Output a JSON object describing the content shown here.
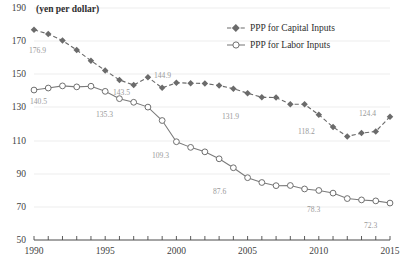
{
  "chart_data": {
    "type": "line",
    "title": "",
    "unit_label": "(yen per dollar)",
    "xlabel": "",
    "ylabel": "",
    "grid": true,
    "legend_position": "top-right",
    "x": [
      1990,
      1991,
      1992,
      1993,
      1994,
      1995,
      1996,
      1997,
      1998,
      1999,
      2000,
      2001,
      2002,
      2003,
      2004,
      2005,
      2006,
      2007,
      2008,
      2009,
      2010,
      2011,
      2012,
      2013,
      2014,
      2015
    ],
    "xlim": [
      1990,
      2015
    ],
    "ylim": [
      50,
      190
    ],
    "ytick_labels": [
      "190",
      "170",
      "150",
      "130",
      "110",
      "90",
      "70",
      "50"
    ],
    "yticks": [
      190,
      170,
      150,
      130,
      110,
      90,
      70,
      50
    ],
    "xtick_labels": [
      "1990",
      "1995",
      "2000",
      "2005",
      "2010",
      "2015"
    ],
    "xticks": [
      1990,
      1995,
      2000,
      2005,
      2010,
      2015
    ],
    "series": [
      {
        "name": "PPP for Capital Inputs",
        "style": "dashed",
        "marker": "filled-diamond",
        "color": "#6b6b6b",
        "values": [
          176.9,
          174.3,
          170.4,
          164.6,
          158.2,
          152.3,
          146.6,
          143.5,
          148.2,
          141.8,
          144.9,
          144.6,
          144.5,
          143.2,
          141.3,
          138.6,
          136.1,
          136.0,
          131.9,
          131.9,
          125.6,
          118.2,
          112.5,
          114.5,
          115.5,
          124.4
        ]
      },
      {
        "name": "PPP for Labor Inputs",
        "style": "solid",
        "marker": "open-circle",
        "color": "#7a7a7a",
        "values": [
          140.5,
          141.7,
          143.0,
          142.4,
          142.8,
          139.7,
          135.3,
          133.1,
          130.2,
          122.1,
          109.3,
          105.9,
          103.2,
          99.0,
          93.6,
          87.6,
          84.7,
          82.8,
          82.9,
          80.8,
          79.9,
          78.3,
          75.0,
          74.2,
          73.6,
          72.3
        ]
      }
    ],
    "annotations": [
      {
        "text": "176.9",
        "x": 1990,
        "y": 176.9,
        "px": 29,
        "py": 53
      },
      {
        "text": "143.5",
        "x": 1997,
        "y": 143.5,
        "px": 113,
        "py": 95
      },
      {
        "text": "135.3",
        "x": 1996,
        "y": 135.3,
        "px": 96,
        "py": 117
      },
      {
        "text": "140.5",
        "x": 1990,
        "y": 140.5,
        "px": 30,
        "py": 104
      },
      {
        "text": "144.9",
        "x": 2000,
        "y": 144.9,
        "px": 154,
        "py": 78
      },
      {
        "text": "131.9",
        "x": 2008,
        "y": 131.9,
        "px": 222,
        "py": 119
      },
      {
        "text": "109.3",
        "x": 2000,
        "y": 109.3,
        "px": 152,
        "py": 158
      },
      {
        "text": "118.2",
        "x": 2011,
        "y": 118.2,
        "px": 298,
        "py": 134
      },
      {
        "text": "87.6",
        "x": 2005,
        "y": 87.6,
        "px": 213,
        "py": 194
      },
      {
        "text": "78.3",
        "x": 2011,
        "y": 78.3,
        "px": 307,
        "py": 212
      },
      {
        "text": "124.4",
        "x": 2015,
        "y": 124.4,
        "px": 359,
        "py": 116
      },
      {
        "text": "72.3",
        "x": 2015,
        "y": 72.3,
        "px": 364,
        "py": 228
      }
    ]
  },
  "legend": {
    "items": [
      {
        "label": "PPP for Capital Inputs"
      },
      {
        "label": "PPP for Labor Inputs"
      }
    ]
  }
}
